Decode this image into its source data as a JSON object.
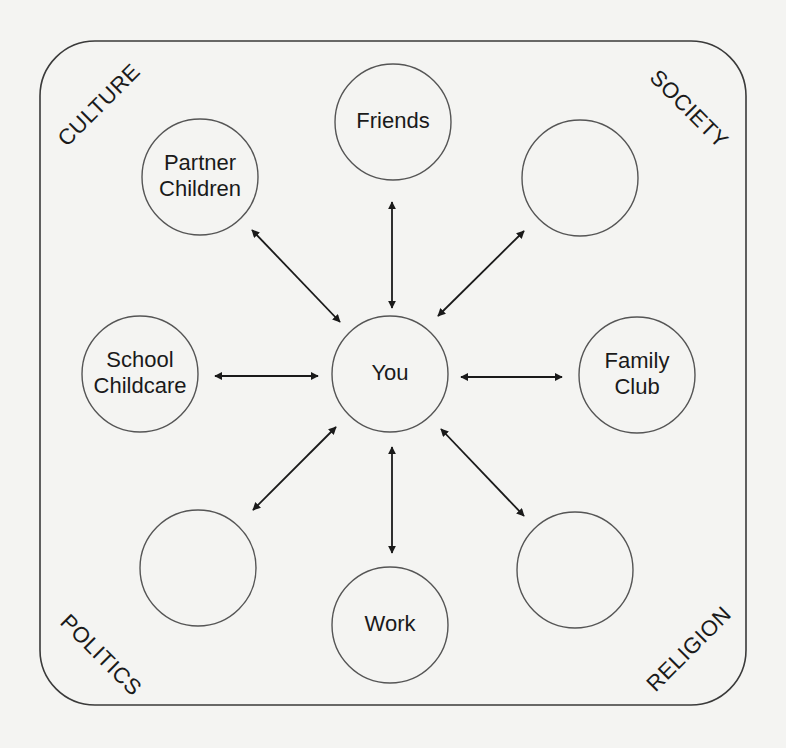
{
  "diagram": {
    "frame": {
      "x": 40,
      "y": 41,
      "width": 706,
      "height": 664,
      "radius": 55
    },
    "corner_labels": {
      "top_left": {
        "text": "CULTURE",
        "x": 100,
        "y": 106,
        "rotate": -45
      },
      "top_right": {
        "text": "SOCIETY",
        "x": 688,
        "y": 110,
        "rotate": 45
      },
      "bottom_left": {
        "text": "POLITICS",
        "x": 100,
        "y": 656,
        "rotate": 45
      },
      "bottom_right": {
        "text": "RELIGION",
        "x": 690,
        "y": 650,
        "rotate": -45
      }
    },
    "nodes": [
      {
        "id": "you",
        "lines": [
          "You"
        ],
        "cx": 390,
        "cy": 374,
        "r": 58
      },
      {
        "id": "friends",
        "lines": [
          "Friends"
        ],
        "cx": 393,
        "cy": 122,
        "r": 58
      },
      {
        "id": "partner-children",
        "lines": [
          "Partner",
          "Children"
        ],
        "cx": 200,
        "cy": 177,
        "r": 58
      },
      {
        "id": "blank-top-right",
        "lines": [],
        "cx": 580,
        "cy": 178,
        "r": 58
      },
      {
        "id": "school-childcare",
        "lines": [
          "School",
          "Childcare"
        ],
        "cx": 140,
        "cy": 374,
        "r": 58
      },
      {
        "id": "family-club",
        "lines": [
          "Family",
          "Club"
        ],
        "cx": 637,
        "cy": 375,
        "r": 58
      },
      {
        "id": "blank-bottom-left",
        "lines": [],
        "cx": 198,
        "cy": 568,
        "r": 58
      },
      {
        "id": "work",
        "lines": [
          "Work"
        ],
        "cx": 390,
        "cy": 625,
        "r": 58
      },
      {
        "id": "blank-bottom-right",
        "lines": [],
        "cx": 575,
        "cy": 570,
        "r": 58
      }
    ],
    "edges": [
      {
        "to": "friends",
        "x1": 392,
        "y1": 308,
        "x2": 392,
        "y2": 202,
        "bidirectional": true
      },
      {
        "to": "partner-children",
        "x1": 340,
        "y1": 322,
        "x2": 252,
        "y2": 230,
        "bidirectional": true
      },
      {
        "to": "blank-top-right",
        "x1": 438,
        "y1": 316,
        "x2": 524,
        "y2": 231,
        "bidirectional": true
      },
      {
        "to": "school-childcare",
        "x1": 318,
        "y1": 376,
        "x2": 215,
        "y2": 376,
        "bidirectional": true
      },
      {
        "to": "family-club",
        "x1": 461,
        "y1": 377,
        "x2": 562,
        "y2": 377,
        "bidirectional": true
      },
      {
        "to": "blank-bottom-left",
        "x1": 336,
        "y1": 427,
        "x2": 253,
        "y2": 510,
        "bidirectional": true
      },
      {
        "to": "work",
        "x1": 392,
        "y1": 447,
        "x2": 392,
        "y2": 553,
        "bidirectional": true
      },
      {
        "to": "blank-bottom-right",
        "x1": 441,
        "y1": 429,
        "x2": 524,
        "y2": 516,
        "bidirectional": true
      }
    ],
    "colors": {
      "background": "#f4f4f2",
      "stroke": "#1a1a1a",
      "circle_stroke": "#555555",
      "frame_stroke": "#3a3a3a"
    }
  }
}
